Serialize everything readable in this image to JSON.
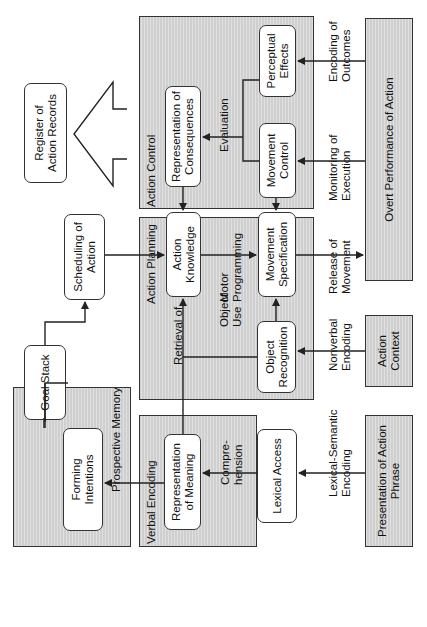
{
  "diagram": {
    "orientation": "rotated 90 degrees counter-clockwise",
    "regions": [
      {
        "id": "prospective-memory",
        "label": "Prospective Memory"
      },
      {
        "id": "verbal-encoding",
        "label": "Verbal Encoding"
      },
      {
        "id": "action-planning",
        "label": "Action Planning"
      },
      {
        "id": "action-control",
        "label": "Action Control"
      }
    ],
    "nodes": {
      "goal_stack": "Goal Stack",
      "scheduling_of_action": "Scheduling of\nAction",
      "forming_intentions": "Forming\nIntentions",
      "representation_of_meaning": "Representation\nof Meaning",
      "lexical_access": "Lexical Access",
      "action_knowledge": "Action\nKnowledge",
      "movement_specification": "Movement\nSpecification",
      "object_recognition": "Object\nRecognition",
      "representation_of_consequences": "Representation of\nConsequences",
      "movement_control": "Movement\nControl",
      "perceptual_effects": "Perceptual\nEffects",
      "register_of_action_records": "Register of\nAction Records",
      "presentation_of_action_phrase": "Presentation of Action\nPhrase",
      "action_context": "Action\nContext",
      "overt_performance_of_action": "Overt Performance of Action"
    },
    "edge_labels": {
      "comprehension": "Compre-\nhension",
      "lexical_semantic_encoding": "Lexical-Semantic\nEncoding",
      "retrieval_of": "Retrieval  of",
      "object_use": "Object\nUse",
      "motor_programming": "Motor\nProgramming",
      "nonverbal_encoding": "Nonverbal\nEncoding",
      "release_of_movement": "Release of\nMovement",
      "evaluation": "Evaluation",
      "monitoring_of_execution": "Monitoring of\nExecution",
      "encoding_of_outcomes": "Encoding of\nOutcomes"
    },
    "edges": [
      {
        "from": "presentation_of_action_phrase",
        "to": "lexical_access",
        "label": "Lexical-Semantic Encoding"
      },
      {
        "from": "lexical_access",
        "to": "representation_of_meaning",
        "label": "Comprehension"
      },
      {
        "from": "representation_of_meaning",
        "to": "forming_intentions"
      },
      {
        "from": "representation_of_meaning",
        "to": "action_knowledge",
        "label": "Retrieval of"
      },
      {
        "from": "forming_intentions",
        "to": "goal_stack"
      },
      {
        "from": "goal_stack",
        "to": "scheduling_of_action"
      },
      {
        "from": "scheduling_of_action",
        "to": "action_knowledge"
      },
      {
        "from": "action_context",
        "to": "object_recognition",
        "label": "Nonverbal Encoding"
      },
      {
        "from": "object_recognition",
        "to": "action_knowledge",
        "label": "Object Use"
      },
      {
        "from": "object_recognition",
        "to": "movement_specification"
      },
      {
        "from": "action_knowledge",
        "to": "movement_specification",
        "label": "Motor Programming"
      },
      {
        "from": "movement_specification",
        "to": "overt_performance_of_action",
        "label": "Release of Movement"
      },
      {
        "from": "representation_of_consequences",
        "to": "action_knowledge"
      },
      {
        "from": "movement_control",
        "to": "movement_specification"
      },
      {
        "from": "movement_control",
        "to": "representation_of_consequences",
        "label": "Evaluation"
      },
      {
        "from": "perceptual_effects",
        "to": "representation_of_consequences",
        "label": "Evaluation"
      },
      {
        "from": "overt_performance_of_action",
        "to": "movement_control",
        "label": "Monitoring of Execution"
      },
      {
        "from": "overt_performance_of_action",
        "to": "perceptual_effects",
        "label": "Encoding of Outcomes"
      },
      {
        "from": "action_control",
        "to": "register_of_action_records"
      }
    ]
  }
}
